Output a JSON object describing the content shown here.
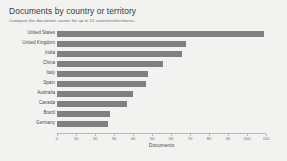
{
  "header": {
    "title": "Documents by country or territory",
    "subtitle": "Compare the document counts for up to 15 countries/territories."
  },
  "chart_data": {
    "type": "bar",
    "orientation": "horizontal",
    "title": "Documents by country or territory",
    "subtitle": "Compare the document counts for up to 15 countries/territories.",
    "xlabel": "Documents",
    "ylabel": "",
    "categories": [
      "United States",
      "United Kingdom",
      "India",
      "China",
      "Italy",
      "Spain",
      "Australia",
      "Canada",
      "Brazil",
      "Germany"
    ],
    "values": [
      109,
      68,
      66,
      56,
      48,
      47,
      40,
      37,
      28,
      27
    ],
    "xlim": [
      0,
      110
    ],
    "xticks": [
      0,
      10,
      20,
      30,
      40,
      50,
      60,
      70,
      80,
      90,
      100,
      110
    ],
    "xtick_labels": [
      "0",
      "10",
      "20",
      "30",
      "40",
      "50",
      "60",
      "70",
      "80",
      "90",
      "100",
      "110"
    ],
    "grid": false,
    "legend": false,
    "bar_color": "#808080",
    "background_color": "#f2f2f0"
  }
}
